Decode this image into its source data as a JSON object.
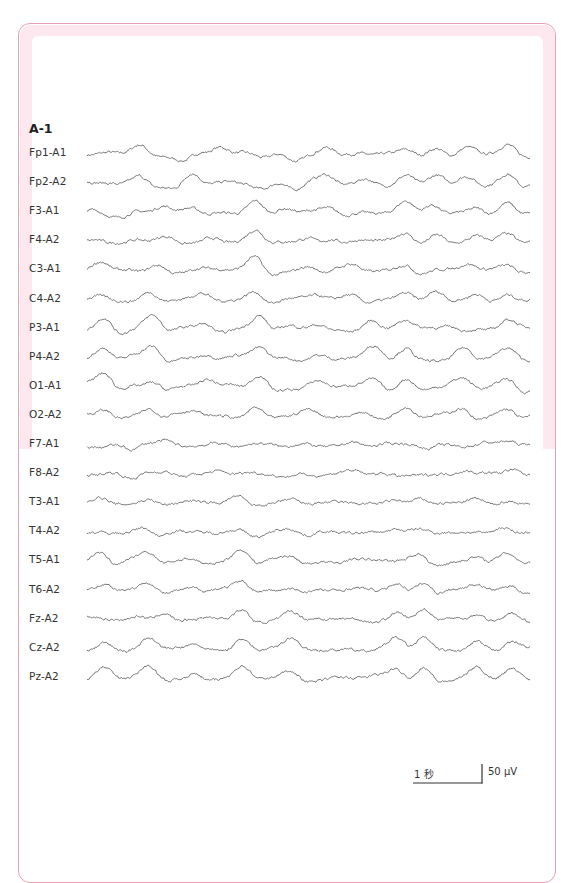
{
  "figure": {
    "panel_label": "A-1",
    "scale_bar": {
      "time_label": "1 秒",
      "amplitude_label": "50 μV"
    },
    "colors": {
      "frame_border": "#e8a0b4",
      "frame_band": "#fde8ef",
      "trace": "#555555"
    }
  },
  "chart_data": {
    "type": "line",
    "title": "A-1",
    "xlabel": "",
    "ylabel": "",
    "scale": {
      "time": "1 秒",
      "amplitude": "50 μV"
    },
    "grid": false,
    "channels": [
      "Fp1-A1",
      "Fp2-A2",
      "F3-A1",
      "F4-A2",
      "C3-A1",
      "C4-A2",
      "P3-A1",
      "P4-A2",
      "O1-A1",
      "O2-A2",
      "F7-A1",
      "F8-A2",
      "T3-A1",
      "T4-A2",
      "T5-A1",
      "T6-A2",
      "Fz-A2",
      "Cz-A2",
      "Pz-A2"
    ],
    "series": [
      {
        "name": "Fp1-A1",
        "amp": 9,
        "peaks": [
          [
            0.02,
            -2
          ],
          [
            0.12,
            8
          ],
          [
            0.22,
            -6
          ],
          [
            0.3,
            7
          ],
          [
            0.4,
            -3
          ],
          [
            0.47,
            -6
          ],
          [
            0.54,
            6
          ],
          [
            0.65,
            -3
          ],
          [
            0.72,
            7
          ],
          [
            0.79,
            7
          ],
          [
            0.86,
            5
          ],
          [
            0.95,
            9
          ]
        ]
      },
      {
        "name": "Fp2-A2",
        "amp": 9,
        "peaks": [
          [
            0.02,
            -2
          ],
          [
            0.12,
            8
          ],
          [
            0.2,
            -6
          ],
          [
            0.24,
            7
          ],
          [
            0.4,
            -4
          ],
          [
            0.47,
            -6
          ],
          [
            0.54,
            6
          ],
          [
            0.63,
            4
          ],
          [
            0.72,
            9
          ],
          [
            0.79,
            8
          ],
          [
            0.86,
            5
          ],
          [
            0.95,
            10
          ]
        ]
      },
      {
        "name": "F3-A1",
        "amp": 9,
        "peaks": [
          [
            0.02,
            3
          ],
          [
            0.08,
            -4
          ],
          [
            0.17,
            5
          ],
          [
            0.24,
            4
          ],
          [
            0.38,
            13
          ],
          [
            0.45,
            3
          ],
          [
            0.55,
            5
          ],
          [
            0.72,
            9
          ],
          [
            0.78,
            8
          ],
          [
            0.88,
            7
          ],
          [
            0.95,
            9
          ]
        ]
      },
      {
        "name": "F4-A2",
        "amp": 7,
        "peaks": [
          [
            0.02,
            3
          ],
          [
            0.08,
            -3
          ],
          [
            0.18,
            4
          ],
          [
            0.28,
            4
          ],
          [
            0.38,
            10
          ],
          [
            0.5,
            3
          ],
          [
            0.55,
            4
          ],
          [
            0.72,
            7
          ],
          [
            0.79,
            8
          ],
          [
            0.88,
            6
          ],
          [
            0.95,
            7
          ]
        ]
      },
      {
        "name": "C3-A1",
        "amp": 9,
        "peaks": [
          [
            0.03,
            8
          ],
          [
            0.16,
            6
          ],
          [
            0.25,
            2
          ],
          [
            0.38,
            13
          ],
          [
            0.5,
            4
          ],
          [
            0.6,
            4
          ],
          [
            0.72,
            7
          ],
          [
            0.86,
            6
          ],
          [
            0.95,
            7
          ]
        ]
      },
      {
        "name": "C4-A2",
        "amp": 8,
        "peaks": [
          [
            0.03,
            3
          ],
          [
            0.14,
            8
          ],
          [
            0.26,
            4
          ],
          [
            0.38,
            9
          ],
          [
            0.52,
            4
          ],
          [
            0.6,
            5
          ],
          [
            0.72,
            8
          ],
          [
            0.79,
            6
          ],
          [
            0.88,
            5
          ],
          [
            0.95,
            7
          ]
        ]
      },
      {
        "name": "P3-A1",
        "amp": 12,
        "peaks": [
          [
            0.04,
            12
          ],
          [
            0.15,
            11
          ],
          [
            0.27,
            6
          ],
          [
            0.39,
            14
          ],
          [
            0.52,
            5
          ],
          [
            0.64,
            8
          ],
          [
            0.72,
            8
          ],
          [
            0.82,
            5
          ],
          [
            0.95,
            8
          ]
        ]
      },
      {
        "name": "P4-A2",
        "amp": 12,
        "peaks": [
          [
            0.04,
            9
          ],
          [
            0.15,
            11
          ],
          [
            0.27,
            6
          ],
          [
            0.39,
            10
          ],
          [
            0.52,
            4
          ],
          [
            0.65,
            9
          ],
          [
            0.72,
            10
          ],
          [
            0.85,
            9
          ],
          [
            0.95,
            7
          ]
        ]
      },
      {
        "name": "O1-A1",
        "amp": 12,
        "peaks": [
          [
            0.04,
            13
          ],
          [
            0.15,
            8
          ],
          [
            0.27,
            7
          ],
          [
            0.39,
            13
          ],
          [
            0.52,
            4
          ],
          [
            0.65,
            8
          ],
          [
            0.72,
            9
          ],
          [
            0.85,
            6
          ],
          [
            0.95,
            9
          ]
        ]
      },
      {
        "name": "O2-A2",
        "amp": 10,
        "peaks": [
          [
            0.04,
            8
          ],
          [
            0.14,
            9
          ],
          [
            0.24,
            5
          ],
          [
            0.38,
            10
          ],
          [
            0.5,
            4
          ],
          [
            0.63,
            5
          ],
          [
            0.72,
            7
          ],
          [
            0.85,
            8
          ],
          [
            0.95,
            8
          ]
        ]
      },
      {
        "name": "F7-A1",
        "amp": 6,
        "peaks": [
          [
            0.03,
            -1
          ],
          [
            0.1,
            -5
          ],
          [
            0.18,
            3
          ],
          [
            0.3,
            3
          ],
          [
            0.45,
            -2
          ],
          [
            0.6,
            3
          ],
          [
            0.77,
            -3
          ],
          [
            0.9,
            2
          ],
          [
            0.95,
            4
          ]
        ]
      },
      {
        "name": "F8-A2",
        "amp": 6,
        "peaks": [
          [
            0.03,
            -1
          ],
          [
            0.1,
            -5
          ],
          [
            0.18,
            3
          ],
          [
            0.3,
            3
          ],
          [
            0.45,
            -2
          ],
          [
            0.6,
            3
          ],
          [
            0.7,
            -2
          ],
          [
            0.85,
            3
          ],
          [
            0.96,
            5
          ]
        ]
      },
      {
        "name": "T3-A1",
        "amp": 4,
        "peaks": [
          [
            0.03,
            5
          ],
          [
            0.14,
            4
          ],
          [
            0.23,
            2
          ],
          [
            0.34,
            7
          ],
          [
            0.46,
            4
          ],
          [
            0.7,
            4
          ],
          [
            0.75,
            5
          ],
          [
            0.88,
            4
          ],
          [
            0.95,
            3
          ]
        ]
      },
      {
        "name": "T4-A2",
        "amp": 3,
        "peaks": [
          [
            0.13,
            5
          ],
          [
            0.16,
            -3
          ],
          [
            0.34,
            3
          ],
          [
            0.39,
            -4
          ],
          [
            0.46,
            3
          ],
          [
            0.5,
            -3
          ],
          [
            0.7,
            3
          ],
          [
            0.75,
            3
          ],
          [
            0.94,
            5
          ]
        ]
      },
      {
        "name": "T5-A1",
        "amp": 9,
        "peaks": [
          [
            0.03,
            10
          ],
          [
            0.14,
            8
          ],
          [
            0.24,
            4
          ],
          [
            0.35,
            12
          ],
          [
            0.46,
            6
          ],
          [
            0.6,
            3
          ],
          [
            0.75,
            7
          ],
          [
            0.88,
            5
          ],
          [
            0.95,
            6
          ]
        ]
      },
      {
        "name": "T6-A2",
        "amp": 8,
        "peaks": [
          [
            0.04,
            6
          ],
          [
            0.14,
            10
          ],
          [
            0.24,
            4
          ],
          [
            0.35,
            9
          ],
          [
            0.46,
            4
          ],
          [
            0.7,
            8
          ],
          [
            0.76,
            10
          ],
          [
            0.88,
            6
          ],
          [
            0.96,
            5
          ]
        ]
      },
      {
        "name": "Fz-A2",
        "amp": 9,
        "peaks": [
          [
            0.02,
            3
          ],
          [
            0.12,
            6
          ],
          [
            0.17,
            7
          ],
          [
            0.35,
            12
          ],
          [
            0.46,
            9
          ],
          [
            0.7,
            7
          ],
          [
            0.76,
            11
          ],
          [
            0.88,
            6
          ],
          [
            0.96,
            9
          ]
        ]
      },
      {
        "name": "Cz-A2",
        "amp": 10,
        "peaks": [
          [
            0.04,
            7
          ],
          [
            0.14,
            10
          ],
          [
            0.24,
            4
          ],
          [
            0.35,
            12
          ],
          [
            0.46,
            9
          ],
          [
            0.7,
            9
          ],
          [
            0.76,
            11
          ],
          [
            0.88,
            8
          ],
          [
            0.96,
            7
          ]
        ]
      },
      {
        "name": "Pz-A2",
        "amp": 10,
        "peaks": [
          [
            0.04,
            10
          ],
          [
            0.14,
            10
          ],
          [
            0.24,
            5
          ],
          [
            0.35,
            10
          ],
          [
            0.46,
            7
          ],
          [
            0.7,
            8
          ],
          [
            0.76,
            12
          ],
          [
            0.88,
            9
          ],
          [
            0.96,
            8
          ]
        ]
      }
    ]
  }
}
